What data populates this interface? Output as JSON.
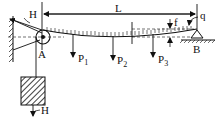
{
  "diagram": {
    "type": "engineering-schematic",
    "labels": {
      "span": "L",
      "tension_top": "H",
      "tension_weight": "H",
      "pulley": "A",
      "support": "B",
      "sag": "f",
      "distributed_load": "q",
      "load1": "P",
      "load1_sub": "1",
      "load2": "P",
      "load2_sub": "2",
      "load3": "P",
      "load3_sub": "3"
    },
    "colors": {
      "ink": "#111111",
      "background": "#ffffff"
    }
  }
}
